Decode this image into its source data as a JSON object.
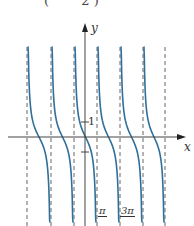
{
  "formula_fragment": {
    "open_paren": "(",
    "denominator": "2",
    "close_paren": ")"
  },
  "chart_data": {
    "type": "line",
    "xlabel": "x",
    "ylabel": "y",
    "function": "y = cot(x - pi/2) = -tan(x)",
    "period": "π",
    "asymptotes": [
      "-7π/2",
      "-5π/2",
      "-3π/2",
      "-π/2",
      "π/2",
      "3π/2",
      "5π/2",
      "7π/2"
    ],
    "zeros": [
      "-3π",
      "-2π",
      "-π",
      "0",
      "π",
      "2π",
      "3π"
    ],
    "x_tick_labels": [
      "π/2",
      "3π/2"
    ],
    "y_tick_labels": [
      "1"
    ],
    "y_ticks": [
      1,
      -1
    ],
    "series": [
      {
        "name": "cot(x − π/2)",
        "color": "#2f6f9a",
        "points_sample": [
          [
            -1.2,
            2.57
          ],
          [
            -0.785,
            1
          ],
          [
            0,
            0
          ],
          [
            0.785,
            -1
          ],
          [
            1.2,
            -2.57
          ]
        ]
      }
    ],
    "asymptote_style": "dashed",
    "grid": false
  },
  "labels": {
    "x_axis": "x",
    "y_axis": "y",
    "tick_one": "1",
    "pi_half": "π",
    "three_pi_half": "3π"
  },
  "colors": {
    "curve": "#2f6f9a",
    "axis": "#444444",
    "asymptote": "#666666"
  }
}
